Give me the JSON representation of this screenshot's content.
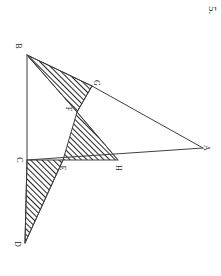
{
  "page": {
    "problem_number": "5.",
    "background_color": "#ffffff",
    "ink_color": "#3a3a3a",
    "hatch_color": "#2a2a2a",
    "width": 221,
    "height": 276,
    "rotation_note": "90"
  },
  "diagram": {
    "points": {
      "A": {
        "label": "A",
        "x": 203,
        "y": 148,
        "label_x": 207,
        "label_y": 149
      },
      "B": {
        "label": "B",
        "x": 27,
        "y": 55,
        "label_x": 19,
        "label_y": 47
      },
      "C": {
        "label": "C",
        "x": 27,
        "y": 160,
        "label_x": 20,
        "label_y": 161
      },
      "D": {
        "label": "D",
        "x": 25,
        "y": 243,
        "label_x": 18,
        "label_y": 245
      },
      "E": {
        "label": "E",
        "x": 63,
        "y": 160,
        "label_x": 64,
        "label_y": 169
      },
      "F": {
        "label": "F",
        "x": 77,
        "y": 112,
        "label_x": 70,
        "label_y": 110
      },
      "G": {
        "label": "G",
        "x": 92,
        "y": 86,
        "label_x": 97,
        "label_y": 84
      },
      "H": {
        "label": "H",
        "x": 118,
        "y": 160,
        "label_x": 119,
        "label_y": 169
      }
    },
    "segments": [
      {
        "name": "segment-B-C",
        "from": "B",
        "to": "C"
      },
      {
        "name": "segment-C-D",
        "from": "C",
        "to": "D"
      },
      {
        "name": "segment-C-A",
        "from": "C",
        "to": "A"
      },
      {
        "name": "segment-B-G",
        "from": "B",
        "to": "G"
      },
      {
        "name": "segment-G-A",
        "from": "G",
        "to": "A"
      },
      {
        "name": "segment-B-F",
        "from": "B",
        "to": "F"
      },
      {
        "name": "segment-F-G",
        "from": "F",
        "to": "G"
      },
      {
        "name": "segment-F-E",
        "from": "F",
        "to": "E"
      },
      {
        "name": "segment-F-H",
        "from": "F",
        "to": "H"
      },
      {
        "name": "segment-D-E",
        "from": "D",
        "to": "E"
      }
    ],
    "shaded_regions": [
      {
        "name": "triangle-B-G-F",
        "vertices": [
          "B",
          "G",
          "F"
        ],
        "fill": "hatch"
      },
      {
        "name": "triangle-F-H-E",
        "vertices": [
          "F",
          "H",
          "E"
        ],
        "fill": "hatch"
      },
      {
        "name": "triangle-C-E-D",
        "vertices": [
          "C",
          "E",
          "D"
        ],
        "fill": "hatch"
      }
    ]
  }
}
